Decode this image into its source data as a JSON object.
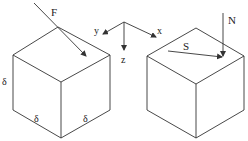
{
  "diagram": {
    "type": "stress-cube-illustration",
    "left_cube": {
      "force_label": "F",
      "edge_labels": [
        "δ",
        "δ",
        "δ"
      ]
    },
    "axes": {
      "x_label": "x",
      "y_label": "y",
      "z_label": "z"
    },
    "right_cube": {
      "normal_label": "N",
      "shear_label": "S"
    },
    "colors": {
      "line": "#333333",
      "background": "#ffffff"
    }
  }
}
